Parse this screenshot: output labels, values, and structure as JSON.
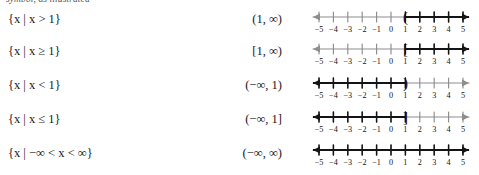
{
  "page": {
    "cutoff_text_top": "symbol, as illustrated"
  },
  "table": {
    "rows": [
      {
        "set_builder_prefix": "{",
        "set_builder_var": "x",
        "set_builder_bar": "|",
        "set_builder_body_var": "x",
        "set_builder_relation": ">",
        "set_builder_value": "1",
        "set_builder_suffix": "}",
        "set_builder_text": "{x | x > 1}",
        "interval": "(1, ∞)",
        "graph": {
          "type": "ray-right",
          "endpoint": 1,
          "endpoint_marker": "(",
          "included": false
        }
      },
      {
        "set_builder_prefix": "{",
        "set_builder_var": "x",
        "set_builder_bar": "|",
        "set_builder_body_var": "x",
        "set_builder_relation": "≥",
        "set_builder_value": "1",
        "set_builder_suffix": "}",
        "set_builder_text": "{x | x ≥ 1}",
        "interval": "[1, ∞)",
        "graph": {
          "type": "ray-right",
          "endpoint": 1,
          "endpoint_marker": "[",
          "included": true
        }
      },
      {
        "set_builder_prefix": "{",
        "set_builder_var": "x",
        "set_builder_bar": "|",
        "set_builder_body_var": "x",
        "set_builder_relation": "<",
        "set_builder_value": "1",
        "set_builder_suffix": "}",
        "set_builder_text": "{x | x < 1}",
        "interval": "(−∞, 1)",
        "graph": {
          "type": "ray-left",
          "endpoint": 1,
          "endpoint_marker": ")",
          "included": false
        }
      },
      {
        "set_builder_prefix": "{",
        "set_builder_var": "x",
        "set_builder_bar": "|",
        "set_builder_body_var": "x",
        "set_builder_relation": "≤",
        "set_builder_value": "1",
        "set_builder_suffix": "}",
        "set_builder_text": "{x | x ≤ 1}",
        "interval": "(−∞, 1]",
        "graph": {
          "type": "ray-left",
          "endpoint": 1,
          "endpoint_marker": "]",
          "included": true
        }
      },
      {
        "set_builder_prefix": "{",
        "set_builder_var": "x",
        "set_builder_bar": "|",
        "set_builder_body_var": "−∞ < x < ∞",
        "set_builder_relation": "",
        "set_builder_value": "",
        "set_builder_suffix": "}",
        "set_builder_text": "{x | −∞ < x < ∞}",
        "interval": "(−∞, ∞)",
        "graph": {
          "type": "full-line",
          "endpoint": null,
          "endpoint_marker": "",
          "included": true
        }
      }
    ]
  },
  "numberline": {
    "tick_labels": [
      "−5",
      "−4",
      "−3",
      "−2",
      "−1",
      "0",
      "1",
      "2",
      "3",
      "4",
      "5"
    ],
    "min": -5,
    "max": 5,
    "colors": {
      "light": "#8d8d8d",
      "bold": "#141414"
    }
  }
}
